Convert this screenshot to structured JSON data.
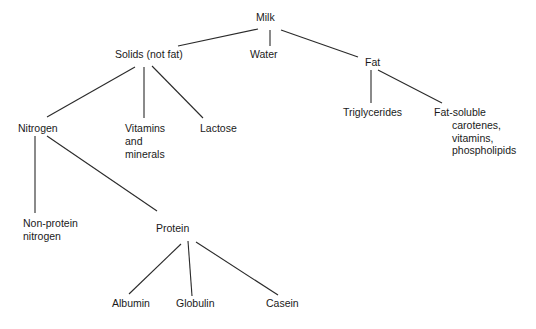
{
  "diagram": {
    "type": "tree",
    "nodes": {
      "milk": {
        "label": "Milk"
      },
      "solids": {
        "label": "Solids (not fat)"
      },
      "water": {
        "label": "Water"
      },
      "fat": {
        "label": "Fat"
      },
      "nitrogen": {
        "label": "Nitrogen"
      },
      "vitamins_minerals": {
        "lines": [
          "Vitamins",
          "and",
          "minerals"
        ]
      },
      "lactose": {
        "label": "Lactose"
      },
      "triglycerides": {
        "label": "Triglycerides"
      },
      "fat_soluble": {
        "lines": [
          "Fat-soluble",
          "carotenes,",
          "vitamins,",
          "phospholipids"
        ]
      },
      "non_protein_nitrogen": {
        "lines": [
          "Non-protein",
          "nitrogen"
        ]
      },
      "protein": {
        "label": "Protein"
      },
      "albumin": {
        "label": "Albumin"
      },
      "globulin": {
        "label": "Globulin"
      },
      "casein": {
        "label": "Casein"
      }
    },
    "edges": [
      [
        "milk",
        "solids"
      ],
      [
        "milk",
        "water"
      ],
      [
        "milk",
        "fat"
      ],
      [
        "solids",
        "nitrogen"
      ],
      [
        "solids",
        "vitamins_minerals"
      ],
      [
        "solids",
        "lactose"
      ],
      [
        "fat",
        "triglycerides"
      ],
      [
        "fat",
        "fat_soluble"
      ],
      [
        "nitrogen",
        "non_protein_nitrogen"
      ],
      [
        "nitrogen",
        "protein"
      ],
      [
        "protein",
        "albumin"
      ],
      [
        "protein",
        "globulin"
      ],
      [
        "protein",
        "casein"
      ]
    ],
    "colors": {
      "background": "#ffffff",
      "text": "#1a1a1a",
      "line": "#2a2a2a"
    }
  }
}
